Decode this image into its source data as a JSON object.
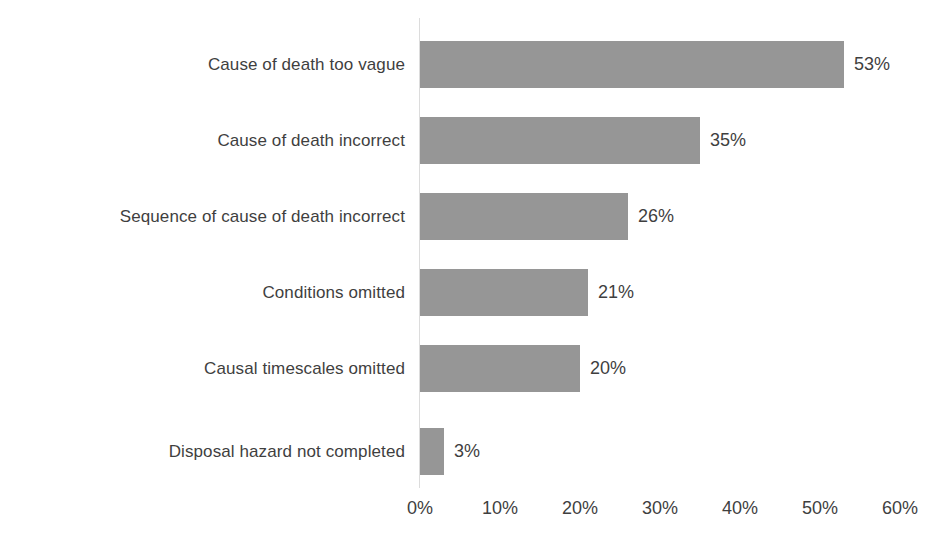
{
  "chart_data": {
    "type": "bar",
    "orientation": "horizontal",
    "title": "",
    "subtitle": "",
    "xlabel": "",
    "ylabel": "",
    "categories": [
      "Cause of death too vague",
      "Cause of death incorrect",
      "Sequence of cause of death incorrect",
      "Conditions omitted",
      "Causal timescales omitted",
      "Disposal hazard not completed"
    ],
    "values": [
      53,
      35,
      26,
      21,
      20,
      3
    ],
    "value_labels": [
      "53%",
      "35%",
      "26%",
      "21%",
      "20%",
      "3%"
    ],
    "xlim": [
      0,
      60
    ],
    "xticks": [
      0,
      10,
      20,
      30,
      40,
      50,
      60
    ],
    "xtick_labels": [
      "0%",
      "10%",
      "20%",
      "30%",
      "40%",
      "50%",
      "60%"
    ],
    "grid": false,
    "legend": null,
    "legend_position": "none",
    "data_labels_shown": true,
    "series": [
      {
        "name": "",
        "values": [
          53,
          35,
          26,
          21,
          20,
          3
        ]
      }
    ]
  },
  "style": {
    "bar_color": "#969696",
    "text_color": "#3f3f3f",
    "axis_line_color": "#dcdcdc",
    "background_color": "#ffffff"
  }
}
